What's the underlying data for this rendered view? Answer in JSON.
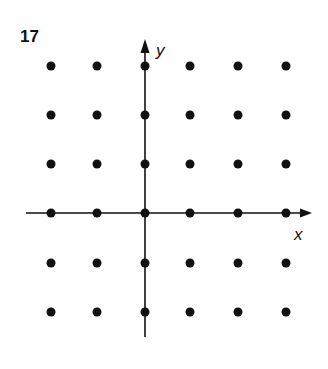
{
  "figure": {
    "number": "17",
    "x_axis_label": "x",
    "y_axis_label": "y",
    "colors": {
      "ink": "#111111",
      "background": "#ffffff"
    }
  },
  "lattice": {
    "columns_px": [
      51,
      97,
      145,
      190,
      238,
      286
    ],
    "rows_px": [
      66,
      115,
      164,
      213,
      263,
      312
    ],
    "dot_radius_px": 4.5,
    "description": "6x6 grid of points; y-axis passes through column 3, x-axis through row 4"
  },
  "axes": {
    "y_axis": {
      "x": 145,
      "y_top": 40,
      "y_bottom": 337
    },
    "x_axis": {
      "y": 213,
      "x_left": 26,
      "x_right": 310
    }
  }
}
